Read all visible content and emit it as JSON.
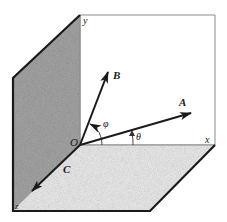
{
  "figure": {
    "colors": {
      "background": "#ffffff",
      "line": "#1a1a1a",
      "frame_light": "#8a8a8a",
      "yz_plane_shade": "#9a9a9a",
      "xz_plane_shade": "#e6e6e6",
      "xy_plane": "#ffffff"
    },
    "axes": {
      "x_label": "x",
      "y_label": "y",
      "z_label": "z",
      "origin_label": "O"
    },
    "vectors": [
      {
        "name": "A",
        "label": "A"
      },
      {
        "name": "B",
        "label": "B"
      },
      {
        "name": "C",
        "label": "C"
      }
    ],
    "angles": [
      {
        "name": "phi",
        "label": "φ"
      },
      {
        "name": "theta",
        "label": "θ"
      }
    ]
  }
}
